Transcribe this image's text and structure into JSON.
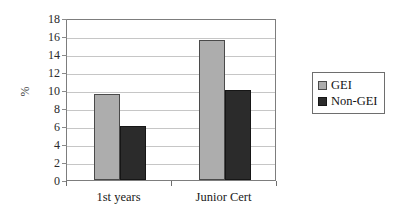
{
  "chart_data": {
    "type": "bar",
    "title": "",
    "xlabel": "",
    "ylabel": "%",
    "categories": [
      "1st years",
      "Junior Cert"
    ],
    "series": [
      {
        "name": "GEI",
        "color": "#adadad",
        "values": [
          9.6,
          15.6
        ]
      },
      {
        "name": "Non-GEI",
        "color": "#2b2b2b",
        "values": [
          6.0,
          10.0
        ]
      }
    ],
    "ylim": [
      0,
      18
    ],
    "ytick_step": 2,
    "yticks": [
      18,
      16,
      14,
      12,
      10,
      8,
      6,
      4,
      2,
      0
    ],
    "ytick_labels": [
      "18",
      "16",
      "14",
      "12",
      "10",
      "8",
      "6",
      "4",
      "2",
      "0"
    ],
    "grid": true,
    "grid_axis": "y",
    "legend_position": "right",
    "legend_entries": [
      "GEI",
      "Non-GEI"
    ],
    "annotations": []
  },
  "axes": {
    "y_label": "%"
  },
  "legend": {
    "items": [
      {
        "label": "GEI"
      },
      {
        "label": "Non-GEI"
      }
    ]
  },
  "colors": {
    "gei": "#adadad",
    "non_gei": "#2b2b2b",
    "gridline": "#c6c6c6",
    "axis": "#7d7d7d",
    "background": "#ffffff"
  }
}
